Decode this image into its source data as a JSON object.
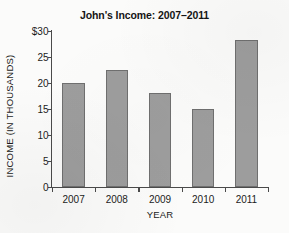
{
  "chart_data": {
    "type": "bar",
    "title": "John's Income: 2007–2011",
    "xlabel": "YEAR",
    "ylabel": "INCOME  (IN THOUSANDS)",
    "categories": [
      "2007",
      "2008",
      "2009",
      "2010",
      "2011"
    ],
    "values": [
      20,
      22.5,
      18,
      15,
      28.3
    ],
    "ylim": [
      0,
      30
    ],
    "yticks": [
      0,
      5,
      10,
      15,
      20,
      25,
      30
    ],
    "ytick_labels": [
      "0",
      "5",
      "10",
      "15",
      "20",
      "25",
      "$30"
    ],
    "grid": false,
    "legend": false,
    "bar_color": "#9d9d9d",
    "bar_edge_color": "#6f6f6f",
    "axis_color": "#4a4a4a",
    "background_color": "#fbfbfa"
  }
}
